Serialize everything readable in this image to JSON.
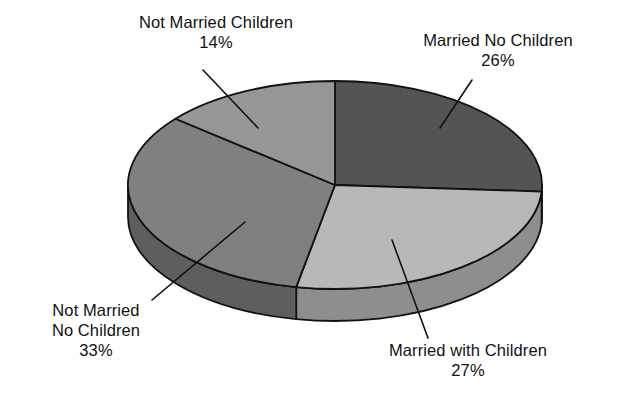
{
  "chart_data": {
    "type": "pie",
    "title": "",
    "subtitle": "",
    "xlabel": "",
    "ylabel": "",
    "legend_position": "none",
    "grid": false,
    "three_d": true,
    "start_angle_deg": 0,
    "direction": "clockwise",
    "units": "percent",
    "categories": [
      "Married No Children",
      "Married with Children",
      "Not Married No Children",
      "Not Married Children"
    ],
    "values": [
      26,
      27,
      33,
      14
    ],
    "total": 100,
    "slices": [
      {
        "label": "Married No Children",
        "value": 26,
        "percent_text": "26%",
        "color": "#545454",
        "side_color": "#3a3a3a"
      },
      {
        "label": "Married with Children",
        "value": 27,
        "percent_text": "27%",
        "color": "#b8b8b8",
        "side_color": "#8e8e8e"
      },
      {
        "label": "Not Married No Children",
        "value": 33,
        "percent_text": "33%",
        "color": "#808080",
        "side_color": "#5e5e5e"
      },
      {
        "label": "Not Married Children",
        "value": 14,
        "percent_text": "14%",
        "color": "#969696",
        "side_color": "#6e6e6e"
      }
    ]
  },
  "labels": {
    "not_married_children": {
      "line1": "Not Married Children",
      "percent": "14%"
    },
    "married_no_children": {
      "line1": "Married No Children",
      "percent": "26%"
    },
    "not_married_no_children": {
      "line1": "Not Married",
      "line2": "No Children",
      "percent": "33%"
    },
    "married_with_children": {
      "line1": "Married with Children",
      "percent": "27%"
    }
  },
  "style": {
    "background": "#ffffff",
    "outline": "#111111",
    "text": "#111111"
  }
}
